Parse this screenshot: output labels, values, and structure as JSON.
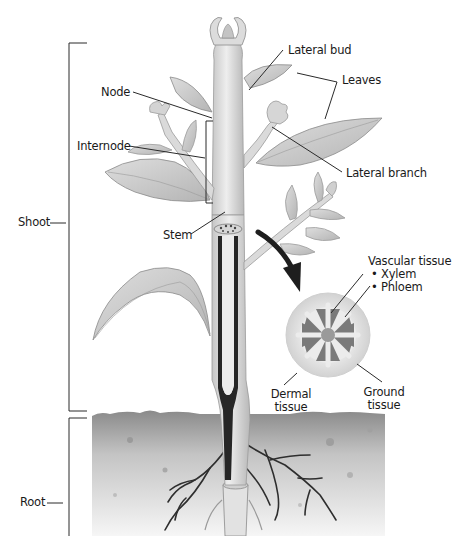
{
  "diagram": {
    "colors": {
      "background": "#ffffff",
      "line": "#333333",
      "plant_light": "#e4e4e4",
      "plant_mid": "#c8c8c8",
      "plant_dark": "#2a2a2a",
      "soil_top": "#8e8e8e",
      "soil_bottom": "#f4f4f4",
      "arrow": "#1e1e1e"
    },
    "regions": {
      "shoot": "Shoot",
      "root": "Root"
    },
    "labels": {
      "lateral_bud": "Lateral bud",
      "leaves": "Leaves",
      "node": "Node",
      "internode": "Internode",
      "lateral_branch": "Lateral branch",
      "stem": "Stem"
    },
    "cross_section": {
      "vascular_title": "Vascular tissue",
      "vascular_items": [
        "• Xylem",
        "• Phloem"
      ],
      "dermal": [
        "Dermal",
        "tissue"
      ],
      "ground": [
        "Ground",
        "tissue"
      ]
    }
  }
}
